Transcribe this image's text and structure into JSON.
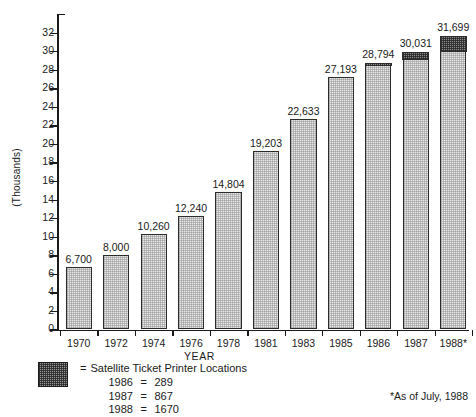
{
  "chart_data": {
    "type": "bar",
    "title": "",
    "xlabel": "YEAR",
    "ylabel": "(Thousands)",
    "ylim": [
      0,
      34
    ],
    "ytick_step": 2,
    "yticks": [
      0,
      2,
      4,
      6,
      8,
      10,
      12,
      14,
      16,
      18,
      20,
      22,
      24,
      26,
      28,
      30,
      32
    ],
    "ytick_labels": [
      "0",
      "2",
      "4",
      "6",
      "8",
      "10",
      "12",
      "14",
      "16",
      "18",
      "20",
      "22",
      "24",
      "26",
      "28",
      "30",
      "32"
    ],
    "grid": false,
    "legend_position": "below-left",
    "categories": [
      "1970",
      "1972",
      "1974",
      "1976",
      "1978",
      "1981",
      "1983",
      "1985",
      "1986",
      "1987",
      "1988*"
    ],
    "values": [
      6700,
      8000,
      10260,
      12240,
      14804,
      19203,
      22633,
      27193,
      28794,
      30031,
      31699
    ],
    "value_labels": [
      "6,700",
      "8,000",
      "10,260",
      "12,240",
      "14,804",
      "19,203",
      "22,633",
      "27,193",
      "28,794",
      "30,031",
      "31,699"
    ],
    "series": [
      {
        "name": "Total",
        "values": [
          6700,
          8000,
          10260,
          12240,
          14804,
          19203,
          22633,
          27193,
          28794,
          30031,
          31699
        ]
      },
      {
        "name": "Satellite Ticket Printer Locations",
        "values": [
          0,
          0,
          0,
          0,
          0,
          0,
          0,
          0,
          289,
          867,
          1670
        ]
      }
    ],
    "annotations": [
      "*As of July, 1988"
    ]
  },
  "axes": {
    "y_title": "(Thousands)",
    "x_title": "YEAR"
  },
  "legend": {
    "equals_sign": "=",
    "title": "Satellite Ticket Printer Locations",
    "rows": [
      {
        "year": "1986",
        "eq": "=",
        "value": "289"
      },
      {
        "year": "1987",
        "eq": "=",
        "value": "867"
      },
      {
        "year": "1988",
        "eq": "=",
        "value": "1670"
      }
    ]
  },
  "footnote": "*As of July, 1988"
}
